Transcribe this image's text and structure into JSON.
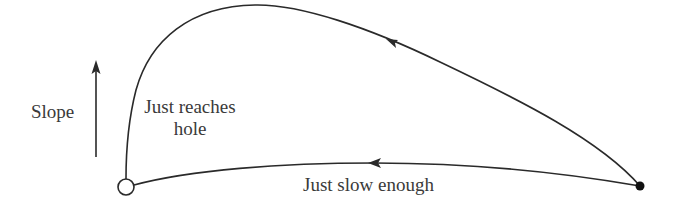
{
  "diagram": {
    "axis": {
      "label": "Slope",
      "direction": "up"
    },
    "start_point": {
      "name": "ball",
      "style": "filled-dot",
      "x": 640,
      "y": 186
    },
    "end_point": {
      "name": "hole",
      "style": "open-circle",
      "x": 126,
      "y": 187
    },
    "paths": [
      {
        "name": "upper-trajectory",
        "label_line1": "Just reaches",
        "label_line2": "hole",
        "arrow_direction": "toward-hole"
      },
      {
        "name": "lower-trajectory",
        "label": "Just slow enough",
        "arrow_direction": "toward-hole"
      }
    ],
    "colors": {
      "stroke": "#2a2a2a",
      "text": "#3a3a3a",
      "background": "#ffffff"
    }
  }
}
